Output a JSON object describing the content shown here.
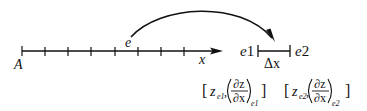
{
  "diagram": {
    "axis": {
      "start_label": "A",
      "axis_label": "x",
      "element_label": "e",
      "tick_count": 8
    },
    "element": {
      "left_node": "e1",
      "right_node": "e2",
      "length_label": "Δx"
    },
    "node_values": [
      {
        "open_bracket": "[",
        "value_symbol": "z",
        "value_sub": "e1",
        "separator": ",",
        "deriv_num": "∂z",
        "deriv_den": "∂x",
        "deriv_sub": "e1",
        "close_bracket": "]"
      },
      {
        "open_bracket": "[",
        "value_symbol": "z",
        "value_sub": "e2",
        "separator": ",",
        "deriv_num": "∂z",
        "deriv_den": "∂x",
        "deriv_sub": "e2",
        "close_bracket": "]"
      }
    ],
    "colors": {
      "stroke": "#111111",
      "background": "#ffffff"
    }
  }
}
